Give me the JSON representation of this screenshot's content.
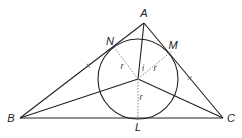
{
  "diagram": {
    "type": "triangle-incircle",
    "points": {
      "A": {
        "label": "A",
        "x": 144,
        "y": 23,
        "lx": 144,
        "ly": 17
      },
      "B": {
        "label": "B",
        "x": 20,
        "y": 118,
        "lx": 11,
        "ly": 122
      },
      "C": {
        "label": "C",
        "x": 223,
        "y": 118,
        "lx": 231,
        "ly": 122
      },
      "N": {
        "label": "N",
        "x": 114,
        "y": 47,
        "lx": 110,
        "ly": 45
      },
      "M": {
        "label": "M",
        "x": 172,
        "y": 51,
        "lx": 173,
        "ly": 49
      },
      "L": {
        "label": "L",
        "x": 138,
        "y": 118,
        "lx": 138,
        "ly": 131
      },
      "I": {
        "x": 138,
        "y": 79
      }
    },
    "incircle": {
      "cx": 138,
      "cy": 79,
      "r": 40
    },
    "radius_labels": [
      {
        "text": "r",
        "x": 122,
        "y": 69
      },
      {
        "text": "r",
        "x": 155,
        "y": 71
      },
      {
        "text": "r",
        "x": 141,
        "y": 100
      }
    ],
    "angle_label": {
      "text": "i",
      "x": 143,
      "y": 71
    },
    "colors": {
      "stroke": "#222222",
      "dotted": "#888888"
    }
  }
}
